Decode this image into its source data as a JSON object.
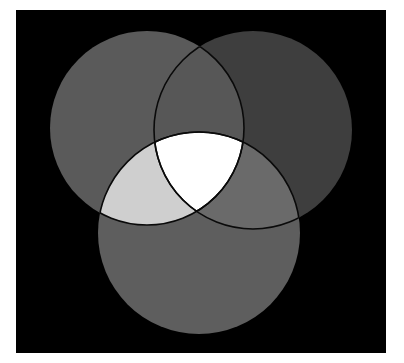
{
  "diagram": {
    "type": "venn-3",
    "background": {
      "x": 16,
      "y": 10,
      "width": 370,
      "height": 343,
      "color": "#000000"
    },
    "page_color": "#ffffff",
    "outline_color": "#0a0a0a",
    "circles": [
      {
        "id": "left",
        "cx": 147,
        "cy": 128,
        "r": 97,
        "color": "#5a5a5a"
      },
      {
        "id": "right",
        "cx": 253,
        "cy": 130,
        "r": 99,
        "color": "#3e3e3e"
      },
      {
        "id": "bottom",
        "cx": 199,
        "cy": 233,
        "r": 101,
        "color": "#5e5e5e"
      }
    ],
    "regions": {
      "left_right": "#575757",
      "left_bottom": "#cfcfcf",
      "right_bottom": "#6a6a6a",
      "center": "#ffffff"
    }
  }
}
